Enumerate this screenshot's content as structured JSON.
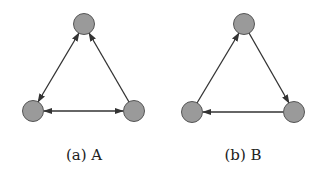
{
  "figure": {
    "panels": [
      {
        "id": "A",
        "caption": "(a) A",
        "nodes": [
          {
            "id": "top",
            "cx": 84,
            "cy": 24
          },
          {
            "id": "bottom-left",
            "cx": 33,
            "cy": 111
          },
          {
            "id": "bottom-right",
            "cx": 134,
            "cy": 111
          }
        ],
        "edges": [
          {
            "from": "top",
            "to": "bottom-left",
            "direction": "bidirectional"
          },
          {
            "from": "top",
            "to": "bottom-right",
            "direction": "bidirectional"
          },
          {
            "from": "bottom-left",
            "to": "bottom-right",
            "direction": "bidirectional"
          }
        ]
      },
      {
        "id": "B",
        "caption": "(b) B",
        "nodes": [
          {
            "id": "top",
            "cx": 244,
            "cy": 24
          },
          {
            "id": "bottom-left",
            "cx": 192,
            "cy": 112
          },
          {
            "id": "bottom-right",
            "cx": 294,
            "cy": 112
          }
        ],
        "edges": [
          {
            "from": "bottom-left",
            "to": "top",
            "direction": "forward"
          },
          {
            "from": "top",
            "to": "bottom-right",
            "direction": "forward"
          },
          {
            "from": "bottom-right",
            "to": "bottom-left",
            "direction": "forward"
          }
        ]
      }
    ],
    "colors": {
      "node_fill": "#9a9a9a",
      "node_stroke": "#555555",
      "edge": "#333333"
    }
  }
}
